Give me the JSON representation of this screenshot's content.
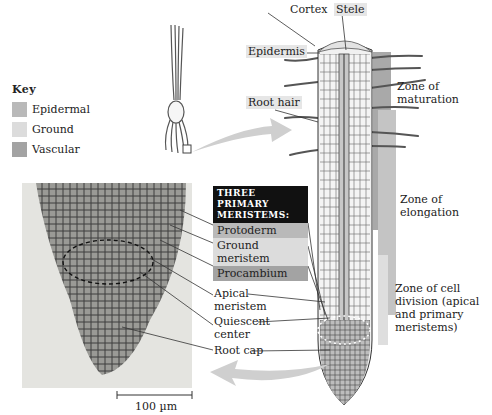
{
  "key": {
    "title": "Key",
    "items": [
      {
        "label": "Epidermal",
        "color": "#b9b9b9"
      },
      {
        "label": "Ground",
        "color": "#dcdcdc"
      },
      {
        "label": "Vascular",
        "color": "#a3a3a3"
      }
    ]
  },
  "root_labels": {
    "cortex": "Cortex",
    "stele": "Stele",
    "epidermis": "Epidermis",
    "root_hair": "Root hair"
  },
  "zones": {
    "maturation": [
      "Zone of",
      "maturation"
    ],
    "elongation": [
      "Zone of",
      "elongation"
    ],
    "cell_division": [
      "Zone of cell",
      "division (apical",
      "and primary",
      "meristems)"
    ]
  },
  "meristems": {
    "heading": [
      "Three primary",
      "meristems:"
    ],
    "items": [
      {
        "label": "Protoderm",
        "color": "#b9b9b9"
      },
      {
        "label": "Ground meristem",
        "lines": [
          "Ground",
          "meristem"
        ],
        "color": "#dcdcdc"
      },
      {
        "label": "Procambium",
        "color": "#a3a3a3"
      }
    ]
  },
  "tip_labels": {
    "apical_meristem": [
      "Apical",
      "meristem"
    ],
    "quiescent_center": [
      "Quiescent",
      "center"
    ],
    "root_cap": "Root cap"
  },
  "scale_bar": {
    "label": "100 µm"
  },
  "colors": {
    "arrow": "#cfcfcf",
    "line": "#333333",
    "micrograph_bg": "#e4e4e0"
  }
}
